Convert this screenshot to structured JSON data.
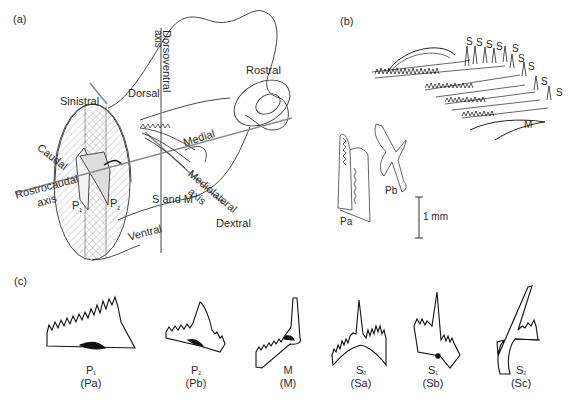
{
  "panels": {
    "a": {
      "label": "(a)",
      "axes": {
        "dorsoventral": "Dorsoventral\naxis",
        "rostrocaudal": "Rostrocaudal\naxis",
        "mediolateral": "Mediolateral\naxis"
      },
      "orientation_labels": {
        "rostral": "Rostral",
        "dorsal": "Dorsal",
        "sinistral": "Sinistral",
        "caudal": "Caudal",
        "medial": "Medial",
        "ventral": "Ventral",
        "dextral": "Dextral"
      },
      "element_labels": {
        "p1": "P",
        "p1_sub": "1",
        "p2": "P",
        "p2_sub": "2",
        "s_and_m": "S and M"
      },
      "axis_words": {
        "dorsoventral_1": "Dorsoventral",
        "dorsoventral_2": "axis",
        "rostrocaudal_1": "Rostrocaudal",
        "rostrocaudal_2": "axis",
        "mediolateral_1": "Mediolateral",
        "mediolateral_2": "axis"
      }
    },
    "b": {
      "label": "(b)",
      "s_labels": [
        "S",
        "S",
        "S",
        "S",
        "S",
        "S",
        "S",
        "S",
        "S"
      ],
      "m_label": "M",
      "pa_label": "Pa",
      "pb_label": "Pb",
      "scale_bar": "1 mm"
    },
    "c": {
      "label": "(c)",
      "elements": [
        {
          "main": "P",
          "sub": "1",
          "alt": "(Pa)"
        },
        {
          "main": "P",
          "sub": "2",
          "alt": "(Pb)"
        },
        {
          "main": "M",
          "sub": "",
          "alt": "(M)"
        },
        {
          "main": "S",
          "sub": "0",
          "alt": "(Sa)"
        },
        {
          "main": "S",
          "sub": "1",
          "alt": "(Sb)"
        },
        {
          "main": "S",
          "sub": "2",
          "alt": "(Sc)"
        }
      ]
    }
  }
}
